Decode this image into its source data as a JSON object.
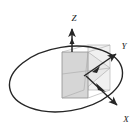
{
  "figure": {
    "background_color": "#ffffff",
    "stroke_color": "#262626",
    "thin_stroke_color": "#9a9a9a",
    "plane_fill_front": "#d8d8d8",
    "plane_fill_back": "#ededed",
    "plane_fill_horizontal": "#e6e6e6"
  },
  "axes": [
    {
      "id": "z",
      "label": "Z",
      "label_x": 74,
      "label_y": 21,
      "direction": "up",
      "arrow_from": [
        72,
        52
      ],
      "arrow_to": [
        72,
        27
      ]
    },
    {
      "id": "y",
      "label": "Y",
      "label_x": 124,
      "label_y": 49,
      "direction": "up-right",
      "arrow_from": [
        90,
        70
      ],
      "arrow_to": [
        117,
        55
      ]
    },
    {
      "id": "x",
      "label": "X",
      "label_x": 126,
      "label_y": 121,
      "direction": "down-right",
      "arrow_from": [
        90,
        70
      ],
      "arrow_to": [
        118,
        106
      ]
    }
  ],
  "ellipse": {
    "name": "orbit-ellipse",
    "center_x": 66,
    "center_y": 79,
    "radius_x": 57,
    "radius_y": 32,
    "rotation_deg": -9,
    "stroke_width": 1.4
  },
  "planes": [
    {
      "id": "vertical-front-plane",
      "points": "62,52 88,52 88,98 62,98"
    },
    {
      "id": "vertical-back-plane",
      "points": "88,45 110,45 110,90 88,90"
    },
    {
      "id": "horizontal-plane",
      "points": "62,74 88,52 110,68 84,90"
    }
  ],
  "origin": {
    "x": 72,
    "y": 52
  }
}
